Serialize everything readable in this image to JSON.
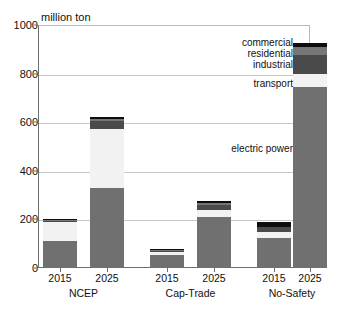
{
  "chart_data": {
    "type": "bar",
    "subtype": "stacked-bar",
    "title": "",
    "xlabel": "",
    "ylabel": "million ton",
    "ylim": [
      0,
      1000
    ],
    "yticks": [
      0,
      200,
      400,
      600,
      800,
      1000
    ],
    "grid": "horizontal",
    "legend_position": "in-plot-right-annotations",
    "groups": [
      "NCEP",
      "Cap-Trade",
      "No-Safety"
    ],
    "categories": [
      "2015",
      "2025",
      "2015",
      "2025",
      "2015",
      "2025"
    ],
    "series": [
      {
        "name": "electric power",
        "color": "#707070",
        "values": [
          110,
          328,
          53,
          210,
          125,
          745
        ]
      },
      {
        "name": "transport",
        "color": "#f2f2f2",
        "values": [
          80,
          245,
          13,
          30,
          22,
          55
        ]
      },
      {
        "name": "industrial",
        "color": "#4a4a4a",
        "values": [
          4,
          30,
          6,
          18,
          20,
          75
        ]
      },
      {
        "name": "residential",
        "color": "#767676",
        "values": [
          3,
          12,
          2,
          10,
          3,
          35
        ]
      },
      {
        "name": "commercial",
        "color": "#0d0d0d",
        "values": [
          4,
          8,
          3,
          10,
          18,
          18
        ]
      }
    ],
    "totals": [
      201,
      623,
      77,
      278,
      188,
      928
    ],
    "annotations": [
      {
        "label": "commercial",
        "points_to": "commercial-segment"
      },
      {
        "label": "residential",
        "points_to": "residential-segment"
      },
      {
        "label": "industrial",
        "points_to": "industrial-segment"
      },
      {
        "label": "transport",
        "points_to": "transport-segment"
      },
      {
        "label": "electric power",
        "points_to": "electric-power-segment"
      }
    ]
  },
  "axis": {
    "y_title": "million ton",
    "y_ticks": [
      "1000",
      "800",
      "600",
      "400",
      "200",
      "0"
    ]
  },
  "x_axis": {
    "ticks": [
      "2015",
      "2025",
      "2015",
      "2025",
      "2015",
      "2025"
    ],
    "groups": [
      "NCEP",
      "Cap-Trade",
      "No-Safety"
    ]
  },
  "annotations": {
    "commercial": "commercial",
    "residential": "residential",
    "industrial": "industrial",
    "transport": "transport",
    "electric_power": "electric power"
  }
}
